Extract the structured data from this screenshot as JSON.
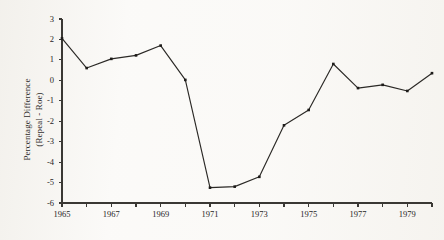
{
  "chart_data": {
    "type": "line",
    "title": "",
    "subtitle": "",
    "xlabel": "",
    "ylabel": "Percentage Difference (Repeal - Roe)",
    "ylabel_line1": "Percentage Difference",
    "ylabel_line2": "(Repeal - Roe)",
    "x": [
      1965,
      1966,
      1967,
      1968,
      1969,
      1970,
      1971,
      1972,
      1973,
      1974,
      1975,
      1976,
      1977,
      1978,
      1979,
      1980
    ],
    "values": [
      2.05,
      0.6,
      1.05,
      1.22,
      1.7,
      0.02,
      -5.25,
      -5.2,
      -4.72,
      -2.2,
      -1.45,
      0.8,
      -0.38,
      -0.22,
      -0.52,
      0.35
    ],
    "series": [
      {
        "name": "Repeal - Roe",
        "values": [
          2.05,
          0.6,
          1.05,
          1.22,
          1.7,
          0.02,
          -5.25,
          -5.2,
          -4.72,
          -2.2,
          -1.45,
          0.8,
          -0.38,
          -0.22,
          -0.52,
          0.35
        ]
      }
    ],
    "xlim": [
      1965,
      1980
    ],
    "ylim": [
      -6,
      3
    ],
    "yticks": [
      3,
      2,
      1,
      0,
      -1,
      -2,
      -3,
      -4,
      -5,
      -6
    ],
    "ytick_labels": [
      "3",
      "2",
      "1",
      "0",
      "-1",
      "-2",
      "-3",
      "-4",
      "-5",
      "-6"
    ],
    "xticks": [
      1965,
      1966,
      1967,
      1968,
      1969,
      1970,
      1971,
      1972,
      1973,
      1974,
      1975,
      1976,
      1977,
      1978,
      1979,
      1980
    ],
    "xtick_labels_shown": [
      "1965",
      "1967",
      "1969",
      "1971",
      "1973",
      "1975",
      "1977",
      "1979"
    ],
    "xtick_label_values": [
      1965,
      1967,
      1969,
      1971,
      1973,
      1975,
      1977,
      1979
    ],
    "grid": false,
    "legend": "none",
    "marker": "square",
    "line_color": "#2b2926",
    "marker_color": "#1d1b19",
    "axis_color": "#3a3834",
    "background_color": "#fbfaf8"
  }
}
